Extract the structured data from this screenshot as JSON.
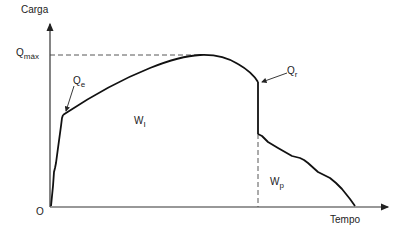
{
  "diagram": {
    "type": "load-time curve",
    "axes": {
      "y_label": "Carga",
      "x_label": "Tempo",
      "origin_label": "O"
    },
    "labels": {
      "q_max": {
        "main": "Q",
        "sub": "máx"
      },
      "q_e": {
        "main": "Q",
        "sub": "e"
      },
      "q_r": {
        "main": "Q",
        "sub": "r"
      },
      "w_i": {
        "main": "W",
        "sub": "I"
      },
      "w_p": {
        "main": "W",
        "sub": "p"
      }
    },
    "colors": {
      "line": "#111111",
      "axis": "#333333",
      "dashed": "#444444"
    }
  }
}
